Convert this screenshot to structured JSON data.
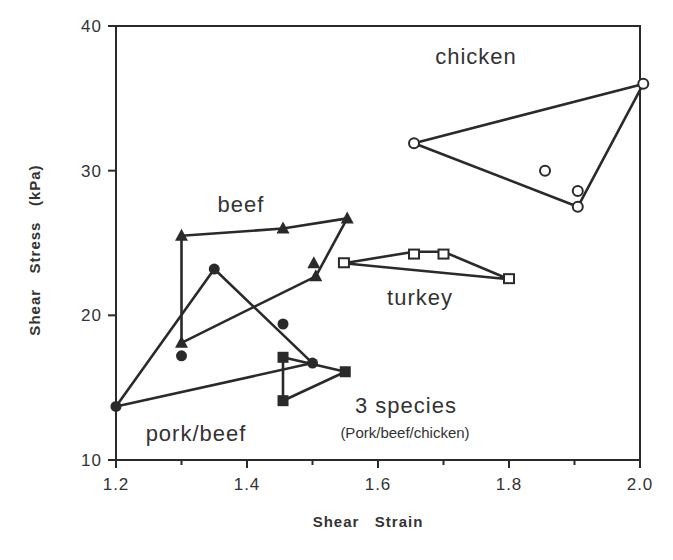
{
  "chart_data": {
    "type": "scatter",
    "title": "",
    "xlabel": "Shear Strain",
    "ylabel": "Shear Stress (kPa)",
    "xlim": [
      1.2,
      2.0
    ],
    "ylim": [
      10,
      40
    ],
    "xticks": [
      "1.2",
      "1.4",
      "1.6",
      "1.8",
      "2.0"
    ],
    "yticks": [
      "10",
      "20",
      "30",
      "40"
    ],
    "grid": false,
    "legend": "none (groups labeled by in-plot annotations)",
    "series": [
      {
        "name": "chicken",
        "marker": "open-circle",
        "points": [
          [
            1.655,
            31.9
          ],
          [
            1.855,
            30.0
          ],
          [
            1.905,
            28.6
          ],
          [
            1.905,
            27.5
          ],
          [
            2.005,
            36.0
          ]
        ],
        "polygon": [
          [
            1.655,
            31.9
          ],
          [
            2.005,
            36.0
          ],
          [
            1.905,
            27.5
          ]
        ]
      },
      {
        "name": "beef",
        "marker": "filled-triangle",
        "points": [
          [
            1.3,
            25.5
          ],
          [
            1.455,
            26.0
          ],
          [
            1.553,
            26.7
          ],
          [
            1.502,
            23.6
          ],
          [
            1.505,
            22.7
          ],
          [
            1.3,
            18.1
          ]
        ],
        "polygon": [
          [
            1.3,
            18.1
          ],
          [
            1.3,
            25.5
          ],
          [
            1.455,
            26.0
          ],
          [
            1.553,
            26.7
          ],
          [
            1.505,
            22.7
          ]
        ]
      },
      {
        "name": "turkey",
        "marker": "open-square",
        "points": [
          [
            1.548,
            23.6
          ],
          [
            1.655,
            24.2
          ],
          [
            1.7,
            24.2
          ],
          [
            1.8,
            22.5
          ]
        ],
        "polygon": [
          [
            1.548,
            23.6
          ],
          [
            1.655,
            24.4
          ],
          [
            1.7,
            24.4
          ],
          [
            1.8,
            22.5
          ]
        ]
      },
      {
        "name": "pork/beef",
        "marker": "filled-circle",
        "points": [
          [
            1.2,
            13.7
          ],
          [
            1.35,
            23.2
          ],
          [
            1.3,
            17.2
          ],
          [
            1.455,
            19.4
          ],
          [
            1.5,
            16.7
          ]
        ],
        "polygon": [
          [
            1.2,
            13.7
          ],
          [
            1.35,
            23.2
          ],
          [
            1.5,
            16.7
          ]
        ]
      },
      {
        "name": "3 species (Pork/beef/chicken)",
        "marker": "filled-square",
        "points": [
          [
            1.455,
            17.1
          ],
          [
            1.455,
            14.1
          ],
          [
            1.55,
            16.1
          ]
        ],
        "polygon": [
          [
            1.455,
            17.1
          ],
          [
            1.455,
            14.1
          ],
          [
            1.55,
            16.1
          ]
        ]
      }
    ],
    "annotations": [
      {
        "text": "chicken",
        "x": 1.72,
        "y": 37.5
      },
      {
        "text": "beef",
        "x": 1.37,
        "y": 27.5
      },
      {
        "text": "turkey",
        "x": 1.67,
        "y": 20.5
      },
      {
        "text": "pork/beef",
        "x": 1.22,
        "y": 11.6
      },
      {
        "text": "3 species",
        "x": 1.62,
        "y": 13.3
      },
      {
        "text": "(Pork/beef/chicken)",
        "x": 1.62,
        "y": 11.6
      }
    ]
  },
  "labels": {
    "x_axis_title": "Shear   Strain",
    "y_axis_title": "Shear   Stress   (kPa)",
    "x_ticks": [
      "1.2",
      "1.4",
      "1.6",
      "1.8",
      "2.0"
    ],
    "y_ticks": [
      "10",
      "20",
      "30",
      "40"
    ],
    "chicken": "chicken",
    "beef": "beef",
    "turkey": "turkey",
    "pork_beef": "pork/beef",
    "three_species": "3  species",
    "three_species_sub": "(Pork/beef/chicken)"
  }
}
